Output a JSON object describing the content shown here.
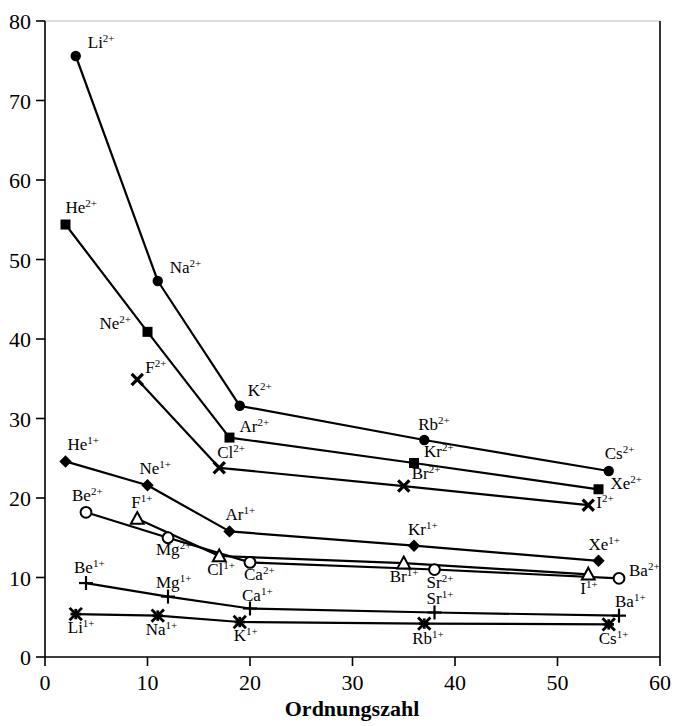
{
  "chart_data": {
    "type": "line",
    "title": "",
    "xlabel": "Ordnungszahl",
    "ylabel": "",
    "xlim": [
      0,
      60
    ],
    "ylim": [
      0,
      80
    ],
    "xticks": [
      0,
      10,
      20,
      30,
      40,
      50,
      60
    ],
    "yticks": [
      0,
      10,
      20,
      30,
      40,
      50,
      60,
      70,
      80
    ],
    "grid": false,
    "legend": "none (points labelled inline)",
    "series": [
      {
        "name": "Li/Na/K/Rb/Cs 2+",
        "marker": "filled-circle",
        "points": [
          {
            "label": "Li",
            "charge": "2+",
            "x": 3,
            "y": 75.6,
            "lx": 12,
            "ly": -8
          },
          {
            "label": "Na",
            "charge": "2+",
            "x": 11,
            "y": 47.3,
            "lx": 12,
            "ly": -8
          },
          {
            "label": "K",
            "charge": "2+",
            "x": 19,
            "y": 31.6,
            "lx": 8,
            "ly": -10
          },
          {
            "label": "Rb",
            "charge": "2+",
            "x": 37,
            "y": 27.3,
            "lx": -6,
            "ly": -10
          },
          {
            "label": "Cs",
            "charge": "2+",
            "x": 55,
            "y": 23.4,
            "lx": -4,
            "ly": -12
          }
        ]
      },
      {
        "name": "He/Ne/Ar/Kr/Xe 2+",
        "marker": "filled-square",
        "points": [
          {
            "label": "He",
            "charge": "2+",
            "x": 2,
            "y": 54.4,
            "lx": 0,
            "ly": -12
          },
          {
            "label": "Ne",
            "charge": "2+",
            "x": 10,
            "y": 40.9,
            "lx": -48,
            "ly": -3
          },
          {
            "label": "Ar",
            "charge": "2+",
            "x": 18,
            "y": 27.6,
            "lx": 10,
            "ly": -6
          },
          {
            "label": "Kr",
            "charge": "2+",
            "x": 36,
            "y": 24.4,
            "lx": 10,
            "ly": -6
          },
          {
            "label": "Xe",
            "charge": "2+",
            "x": 54,
            "y": 21.1,
            "lx": 12,
            "ly": 0
          }
        ]
      },
      {
        "name": "F/Cl/Br/I 2+",
        "marker": "x",
        "points": [
          {
            "label": "F",
            "charge": "2+",
            "x": 9,
            "y": 34.9,
            "lx": 8,
            "ly": -7
          },
          {
            "label": "Cl",
            "charge": "2+",
            "x": 17,
            "y": 23.8,
            "lx": -2,
            "ly": -10
          },
          {
            "label": "Br",
            "charge": "2+",
            "x": 35,
            "y": 21.5,
            "lx": 8,
            "ly": -7
          },
          {
            "label": "I",
            "charge": "2+",
            "x": 53,
            "y": 19.1,
            "lx": 8,
            "ly": 3
          }
        ]
      },
      {
        "name": "He/Ne/Ar/Kr/Xe 1+",
        "marker": "filled-diamond",
        "points": [
          {
            "label": "He",
            "charge": "1+",
            "x": 2,
            "y": 24.6,
            "lx": 2,
            "ly": -11
          },
          {
            "label": "Ne",
            "charge": "1+",
            "x": 10,
            "y": 21.6,
            "lx": -8,
            "ly": -11
          },
          {
            "label": "Ar",
            "charge": "1+",
            "x": 18,
            "y": 15.8,
            "lx": -4,
            "ly": -11
          },
          {
            "label": "Kr",
            "charge": "1+",
            "x": 36,
            "y": 14.0,
            "lx": -6,
            "ly": -11
          },
          {
            "label": "Xe",
            "charge": "1+",
            "x": 54,
            "y": 12.1,
            "lx": -10,
            "ly": -11
          }
        ]
      },
      {
        "name": "Be/Mg/Ca/Sr/Ba 2+",
        "marker": "open-circle",
        "points": [
          {
            "label": "Be",
            "charge": "2+",
            "x": 4,
            "y": 18.2,
            "lx": -14,
            "ly": -11
          },
          {
            "label": "Mg",
            "charge": "2+",
            "x": 12,
            "y": 15.0,
            "lx": -12,
            "ly": 17
          },
          {
            "label": "Ca",
            "charge": "2+",
            "x": 20,
            "y": 11.9,
            "lx": -6,
            "ly": 18
          },
          {
            "label": "Sr",
            "charge": "2+",
            "x": 38,
            "y": 11.0,
            "lx": -8,
            "ly": 18
          },
          {
            "label": "Ba",
            "charge": "2+",
            "x": 56,
            "y": 9.9,
            "lx": 10,
            "ly": -2
          }
        ]
      },
      {
        "name": "F/Cl/Br/I 1+",
        "marker": "open-triangle",
        "points": [
          {
            "label": "F",
            "charge": "1+",
            "x": 9,
            "y": 17.4,
            "lx": -6,
            "ly": -11
          },
          {
            "label": "Cl",
            "charge": "1+",
            "x": 17,
            "y": 12.7,
            "lx": -12,
            "ly": 19
          },
          {
            "label": "Br",
            "charge": "1+",
            "x": 35,
            "y": 11.8,
            "lx": -14,
            "ly": 19
          },
          {
            "label": "I",
            "charge": "1+",
            "x": 53,
            "y": 10.4,
            "lx": -8,
            "ly": 20
          }
        ]
      },
      {
        "name": "Be/Mg/Ca/Sr/Ba 1+",
        "marker": "plus",
        "points": [
          {
            "label": "Be",
            "charge": "1+",
            "x": 4,
            "y": 9.3,
            "lx": -12,
            "ly": -10
          },
          {
            "label": "Mg",
            "charge": "1+",
            "x": 12,
            "y": 7.6,
            "lx": -12,
            "ly": -9
          },
          {
            "label": "Ca",
            "charge": "1+",
            "x": 20,
            "y": 6.1,
            "lx": -8,
            "ly": -8
          },
          {
            "label": "Sr",
            "charge": "1+",
            "x": 38,
            "y": 5.6,
            "lx": -8,
            "ly": -8
          },
          {
            "label": "Ba",
            "charge": "1+",
            "x": 56,
            "y": 5.2,
            "lx": -4,
            "ly": -9
          }
        ]
      },
      {
        "name": "Li/Na/K/Rb/Cs 1+",
        "marker": "star-x",
        "points": [
          {
            "label": "Li",
            "charge": "1+",
            "x": 3,
            "y": 5.4,
            "lx": -8,
            "ly": 19
          },
          {
            "label": "Na",
            "charge": "1+",
            "x": 11,
            "y": 5.2,
            "lx": -12,
            "ly": 19
          },
          {
            "label": "K",
            "charge": "1+",
            "x": 19,
            "y": 4.4,
            "lx": -6,
            "ly": 19
          },
          {
            "label": "Rb",
            "charge": "1+",
            "x": 37,
            "y": 4.2,
            "lx": -12,
            "ly": 20
          },
          {
            "label": "Cs",
            "charge": "1+",
            "x": 55,
            "y": 4.1,
            "lx": -10,
            "ly": 20
          }
        ]
      }
    ]
  },
  "axes": {
    "x_title": "Ordnungszahl",
    "x_tick_labels": [
      "0",
      "10",
      "20",
      "30",
      "40",
      "50",
      "60"
    ],
    "y_tick_labels": [
      "0",
      "10",
      "20",
      "30",
      "40",
      "50",
      "60",
      "70",
      "80"
    ]
  }
}
